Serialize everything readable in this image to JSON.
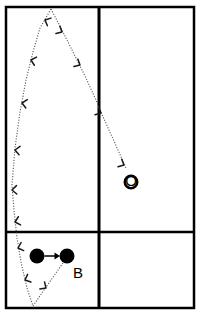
{
  "diagram": {
    "type": "sports-play-diagram",
    "canvas": {
      "width": 203,
      "height": 318
    },
    "background_color": "#ffffff",
    "line_color": "#000000",
    "path_color": "#5a5a5a"
  },
  "court": {
    "name": "court",
    "outline": {
      "x": 6,
      "y": 7,
      "width": 188,
      "height": 301,
      "stroke_width": 2.5
    },
    "center_vertical_line": {
      "x": 99,
      "y1": 7,
      "y2": 308,
      "stroke_width": 3.0
    },
    "horizontal_line": {
      "x1": 6,
      "x2": 194,
      "y": 232,
      "stroke_width": 2.5
    },
    "quadrants": [
      "upper-left",
      "upper-right",
      "lower-left",
      "lower-right"
    ]
  },
  "labels": [
    {
      "name": "label-o",
      "text": "O",
      "x": 131,
      "y": 182,
      "size": 15
    },
    {
      "name": "label-b",
      "text": "B",
      "x": 78,
      "y": 274,
      "size": 15
    }
  ],
  "players": [
    {
      "name": "player-ball-source",
      "marker": "filled-circle",
      "x": 37,
      "y": 256,
      "radius": 7.5,
      "color": "#000000"
    },
    {
      "name": "player-ball-target",
      "marker": "filled-circle",
      "x": 67,
      "y": 256,
      "radius": 7.5,
      "color": "#000000"
    },
    {
      "name": "player-o-open",
      "marker": "open-circle",
      "x": 131,
      "y": 182,
      "radius": 6.2,
      "color": "#000000"
    }
  ],
  "pass": {
    "name": "pass-arrow",
    "from": {
      "x": 45,
      "y": 256
    },
    "to": {
      "x": 60,
      "y": 256
    },
    "style": "solid-arrow"
  },
  "movement_paths": [
    {
      "name": "path-left-descending",
      "style": "dotted",
      "description": "from apex down-left along left sideline into lower-left quadrant",
      "points": [
        [
          51,
          9
        ],
        [
          40,
          28
        ],
        [
          33,
          52
        ],
        [
          26,
          80
        ],
        [
          20,
          112
        ],
        [
          15,
          148
        ],
        [
          12,
          185
        ],
        [
          14,
          210
        ],
        [
          17,
          238
        ],
        [
          21,
          262
        ],
        [
          27,
          288
        ],
        [
          33,
          306
        ]
      ],
      "arrow_direction": "down",
      "chevrons": [
        {
          "x": 45,
          "y": 20,
          "angle": 115
        },
        {
          "x": 31,
          "y": 60,
          "angle": 105
        },
        {
          "x": 22,
          "y": 103,
          "angle": 100
        },
        {
          "x": 15,
          "y": 150,
          "angle": 97
        },
        {
          "x": 12,
          "y": 190,
          "angle": 88
        },
        {
          "x": 15,
          "y": 222,
          "angle": 75
        },
        {
          "x": 18,
          "y": 248,
          "angle": 72
        },
        {
          "x": 25,
          "y": 280,
          "angle": 67
        }
      ]
    },
    {
      "name": "path-right-ascending",
      "style": "dotted",
      "description": "from lower-left vertex up-right to apex",
      "points": [
        [
          33,
          306
        ],
        [
          44,
          290
        ],
        [
          56,
          273
        ],
        [
          67,
          257
        ]
      ],
      "arrow_direction": "up-right",
      "chevrons": [
        {
          "x": 46,
          "y": 288,
          "angle": -56
        }
      ]
    },
    {
      "name": "path-apex-to-divider",
      "style": "dotted",
      "description": "from apex down-right to center divider line",
      "points": [
        [
          51,
          9
        ],
        [
          62,
          30
        ],
        [
          73,
          52
        ],
        [
          85,
          76
        ],
        [
          96,
          100
        ],
        [
          100,
          110
        ]
      ],
      "arrow_direction": "up-left",
      "chevrons": [
        {
          "x": 62,
          "y": 32,
          "angle": -62
        },
        {
          "x": 80,
          "y": 65,
          "angle": -62
        }
      ]
    },
    {
      "name": "path-divider-to-o",
      "style": "dotted",
      "description": "from center divider down-right toward open circle O",
      "points": [
        [
          100,
          110
        ],
        [
          109,
          130
        ],
        [
          118,
          150
        ],
        [
          126,
          168
        ]
      ],
      "arrow_direction": "up-left",
      "chevrons": [
        {
          "x": 101,
          "y": 113,
          "angle": -64
        },
        {
          "x": 124,
          "y": 165,
          "angle": -64
        }
      ]
    }
  ]
}
